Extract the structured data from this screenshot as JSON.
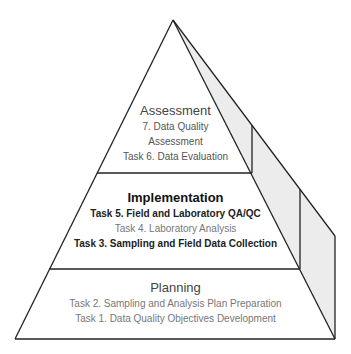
{
  "diagram": {
    "type": "pyramid",
    "colors": {
      "line": "#222222",
      "side_fill": "#ececec",
      "front_fill": "#ffffff"
    },
    "layers": [
      {
        "name": "Assessment",
        "title": "Assessment",
        "items": [
          "7. Data Quality",
          "Assessment",
          "Task 6. Data Evaluation"
        ]
      },
      {
        "name": "Implementation",
        "title": "Implementation",
        "items": [
          "Task 5. Field and Laboratory QA/QC",
          "Task 4. Laboratory Analysis",
          "Task 3. Sampling and Field Data Collection"
        ]
      },
      {
        "name": "Planning",
        "title": "Planning",
        "items": [
          "Task 2. Sampling and Analysis Plan Preparation",
          "Task 1. Data Quality Objectives Development"
        ]
      }
    ]
  }
}
